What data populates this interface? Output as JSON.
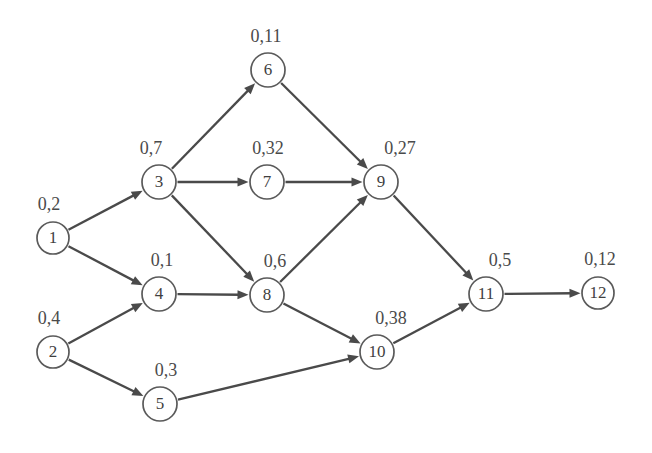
{
  "diagram": {
    "background_color": "#ffffff",
    "node_stroke_color": "#5a5a5a",
    "edge_color": "#4a4a4a",
    "text_color": "#4a4a4a",
    "node_radius": 16,
    "width": 652,
    "height": 453,
    "nodes": [
      {
        "id": "1",
        "label": "1",
        "weight": "0,2",
        "x": 53,
        "y": 238,
        "r": 16,
        "wx": 49,
        "wy": 210
      },
      {
        "id": "2",
        "label": "2",
        "weight": "0,4",
        "x": 53,
        "y": 352,
        "r": 16,
        "wx": 49,
        "wy": 324
      },
      {
        "id": "3",
        "label": "3",
        "weight": "0,7",
        "x": 159,
        "y": 182,
        "r": 17,
        "wx": 151,
        "wy": 154
      },
      {
        "id": "4",
        "label": "4",
        "weight": "0,1",
        "x": 159,
        "y": 294,
        "r": 17,
        "wx": 162,
        "wy": 266
      },
      {
        "id": "5",
        "label": "5",
        "weight": "0,3",
        "x": 160,
        "y": 404,
        "r": 17,
        "wx": 166,
        "wy": 376
      },
      {
        "id": "6",
        "label": "6",
        "weight": "0,11",
        "x": 268,
        "y": 70,
        "r": 17,
        "wx": 266,
        "wy": 42
      },
      {
        "id": "7",
        "label": "7",
        "weight": "0,32",
        "x": 267,
        "y": 182,
        "r": 17,
        "wx": 268,
        "wy": 154
      },
      {
        "id": "8",
        "label": "8",
        "weight": "0,6",
        "x": 267,
        "y": 295,
        "r": 17,
        "wx": 275,
        "wy": 267
      },
      {
        "id": "9",
        "label": "9",
        "weight": "0,27",
        "x": 381,
        "y": 182,
        "r": 17,
        "wx": 400,
        "wy": 154
      },
      {
        "id": "10",
        "label": "10",
        "weight": "0,38",
        "x": 377,
        "y": 352,
        "r": 17,
        "wx": 391,
        "wy": 324
      },
      {
        "id": "11",
        "label": "11",
        "weight": "0,5",
        "x": 486,
        "y": 294,
        "r": 17,
        "wx": 500,
        "wy": 266
      },
      {
        "id": "12",
        "label": "12",
        "weight": "0,12",
        "x": 598,
        "y": 293,
        "r": 16,
        "wx": 600,
        "wy": 265
      }
    ],
    "edges": [
      {
        "from": "1",
        "to": "3"
      },
      {
        "from": "1",
        "to": "4"
      },
      {
        "from": "2",
        "to": "4"
      },
      {
        "from": "2",
        "to": "5"
      },
      {
        "from": "3",
        "to": "6"
      },
      {
        "from": "3",
        "to": "7"
      },
      {
        "from": "3",
        "to": "8"
      },
      {
        "from": "4",
        "to": "8"
      },
      {
        "from": "5",
        "to": "10"
      },
      {
        "from": "6",
        "to": "9"
      },
      {
        "from": "7",
        "to": "9"
      },
      {
        "from": "8",
        "to": "9"
      },
      {
        "from": "8",
        "to": "10"
      },
      {
        "from": "9",
        "to": "11"
      },
      {
        "from": "10",
        "to": "11"
      },
      {
        "from": "11",
        "to": "12"
      }
    ]
  }
}
